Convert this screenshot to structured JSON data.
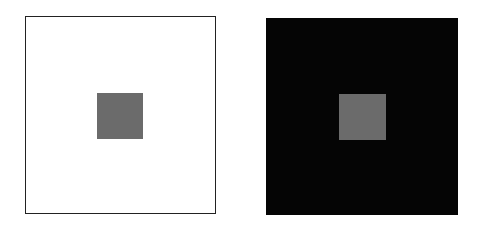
{
  "figure": {
    "panels": [
      {
        "name": "light-panel",
        "background": "#ffffff",
        "border": "#222222",
        "x": 25,
        "y": 16,
        "width": 191,
        "height": 198,
        "square": {
          "color": "#6b6b6b",
          "x": 97,
          "y": 93,
          "width": 46,
          "height": 46
        }
      },
      {
        "name": "dark-panel",
        "background": "#050505",
        "border": "none",
        "x": 266,
        "y": 18,
        "width": 192,
        "height": 197,
        "square": {
          "color": "#6b6b6b",
          "x": 339,
          "y": 94,
          "width": 47,
          "height": 46
        }
      }
    ]
  }
}
